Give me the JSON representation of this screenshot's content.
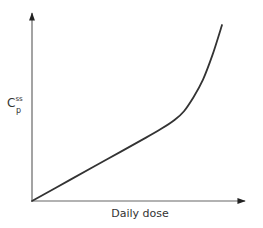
{
  "chart_data": {
    "type": "line",
    "title": "",
    "xlabel": "Daily dose",
    "ylabel": "C_p^ss",
    "ylabel_main": "C",
    "ylabel_sup": "ss",
    "ylabel_sub": "p",
    "x_ticks": [],
    "y_ticks": [],
    "grid": false,
    "legend": null,
    "series": [
      {
        "name": "Steady-state plasma concentration",
        "description": "Linear increase with dose, then sharp nonlinear rise at high doses",
        "x": [
          0,
          0.2,
          0.4,
          0.6,
          0.68,
          0.75,
          0.8,
          0.85,
          0.9,
          0.95,
          1.0
        ],
        "y": [
          0,
          0.12,
          0.24,
          0.36,
          0.41,
          0.46,
          0.51,
          0.59,
          0.69,
          0.83,
          1.0
        ]
      }
    ],
    "colors": {
      "line": "#333333",
      "axis": "#555555"
    }
  }
}
